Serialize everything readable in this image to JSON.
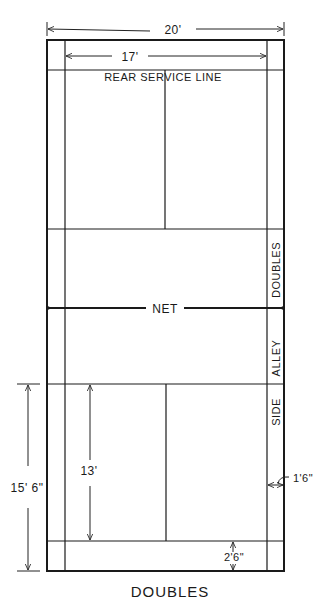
{
  "diagram": {
    "title": "DOUBLES",
    "labels": {
      "rear_service_line": "REAR SERVICE LINE",
      "net": "NET",
      "side_alley_word1": "DOUBLES",
      "side_alley_word2": "ALLEY",
      "side_alley_word3": "SIDE"
    },
    "dimensions": {
      "outer_width": "20'",
      "inner_width": "17'",
      "half_court_length": "15' 6\"",
      "service_box_length": "13'",
      "alley_width": "1'6\"",
      "back_service_depth": "2'6\""
    },
    "colors": {
      "line": "#1a1a1a",
      "background": "#ffffff"
    }
  }
}
